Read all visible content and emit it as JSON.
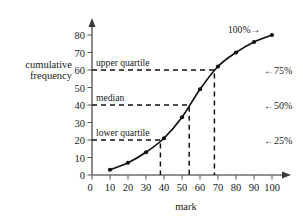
{
  "chart_data": {
    "type": "line",
    "title": "",
    "subtitle": "",
    "xlabel": "mark",
    "ylabel": "cumulative frequency",
    "ylabel_line1": "cumulative",
    "ylabel_line2": "frequency",
    "xlim": [
      0,
      100
    ],
    "ylim": [
      0,
      80
    ],
    "xticks": [
      0,
      10,
      20,
      30,
      40,
      50,
      60,
      70,
      80,
      90,
      100
    ],
    "yticks": [
      0,
      10,
      20,
      30,
      40,
      50,
      60,
      70,
      80
    ],
    "xtick_labels": [
      "0",
      "10",
      "20",
      "30",
      "40",
      "50",
      "60",
      "70",
      "80",
      "90",
      "100"
    ],
    "ytick_labels": [
      "0",
      "10",
      "20",
      "30",
      "40",
      "50",
      "60",
      "70",
      "80"
    ],
    "grid": false,
    "legend": "none",
    "series": [
      {
        "name": "cumulative frequency",
        "x": [
          10,
          20,
          30,
          40,
          50,
          60,
          70,
          80,
          90,
          100
        ],
        "values": [
          3,
          7,
          13,
          21,
          33,
          49,
          62,
          70,
          76,
          80
        ],
        "marker": "filled-circle"
      }
    ],
    "annotations": [
      {
        "id": "upper-quartile",
        "text": "upper quartile",
        "cf": 60,
        "mark": 68
      },
      {
        "id": "median",
        "text": "median",
        "cf": 40,
        "mark": 54
      },
      {
        "id": "lower-quartile",
        "text": "lower quartile",
        "cf": 20,
        "mark": 38
      },
      {
        "id": "hundred-percent",
        "text": "100%→",
        "cf": 80,
        "mark": 100
      }
    ],
    "right_axis_labels": [
      {
        "id": "pct-75",
        "text": "←75%",
        "cf": 60
      },
      {
        "id": "pct-50",
        "text": "←50%",
        "cf": 40
      },
      {
        "id": "pct-25",
        "text": "←25%",
        "cf": 20
      }
    ]
  },
  "axes": {
    "x_title": "mark",
    "y_title_line1": "cumulative",
    "y_title_line2": "frequency"
  },
  "annotations": {
    "upper_quartile": "upper quartile",
    "median": "median",
    "lower_quartile": "lower quartile",
    "hundred_percent": "100%→"
  },
  "right_labels": {
    "p75": "←75%",
    "p50": "←50%",
    "p25": "←25%"
  },
  "colors": {
    "curve": "#111111",
    "axis": "#6e6e6e",
    "guide": "#111111",
    "text": "#1a1a1a",
    "background": "#ffffff"
  }
}
